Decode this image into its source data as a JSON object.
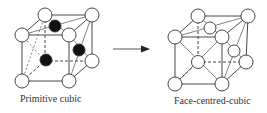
{
  "diagram": {
    "left": {
      "label": "Primitive cubic"
    },
    "right": {
      "label": "Face-centred-cubic"
    },
    "arrow": {
      "direction": "right"
    }
  }
}
